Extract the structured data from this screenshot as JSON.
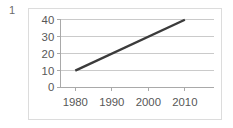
{
  "figure": {
    "number_label": "1"
  },
  "chart_data": {
    "type": "line",
    "title": "",
    "subtitle": "",
    "xlabel": "",
    "ylabel": "",
    "x": [
      1980,
      1990,
      2000,
      2010
    ],
    "series": [
      {
        "name": "",
        "x": [
          1980,
          2010
        ],
        "values": [
          10,
          40
        ],
        "color": "#3b3b3b",
        "line_width": 2.4
      }
    ],
    "xlim": [
      1976,
      2018
    ],
    "ylim": [
      0,
      40
    ],
    "xticks": [
      1980,
      1990,
      2000,
      2010
    ],
    "xtick_labels": [
      "1980",
      "1990",
      "2000",
      "2010"
    ],
    "yticks": [
      0,
      10,
      20,
      30,
      40
    ],
    "ytick_labels": [
      "0",
      "10",
      "20",
      "30",
      "40"
    ],
    "grid": true,
    "grid_axis": "y",
    "grid_color": "#c9c9c9",
    "axis_color": "#a8a8a8",
    "legend": false,
    "legend_position": "none",
    "annotations": [],
    "plot_background": "#ffffff",
    "frame_border_color": "#dcdcdc"
  }
}
